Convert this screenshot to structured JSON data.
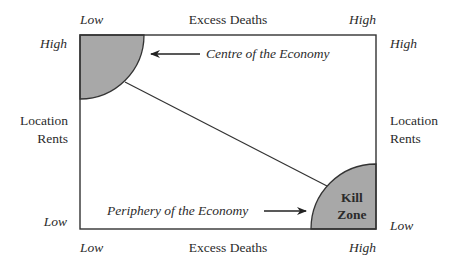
{
  "diagram": {
    "x_axis": {
      "label": "Excess Deaths",
      "low": "Low",
      "high": "High"
    },
    "y_axis": {
      "label_line1": "Location",
      "label_line2": "Rents",
      "low": "Low",
      "high": "High"
    },
    "regions": {
      "centre": {
        "label": "Centre of the Economy",
        "fill": "#a8a8a8"
      },
      "kill_zone": {
        "label_line1": "Kill",
        "label_line2": "Zone",
        "fill": "#a8a8a8"
      },
      "periphery": {
        "label": "Periphery of the Economy"
      }
    },
    "colors": {
      "line": "#333333",
      "text": "#2b2b2b",
      "background": "#ffffff"
    }
  }
}
